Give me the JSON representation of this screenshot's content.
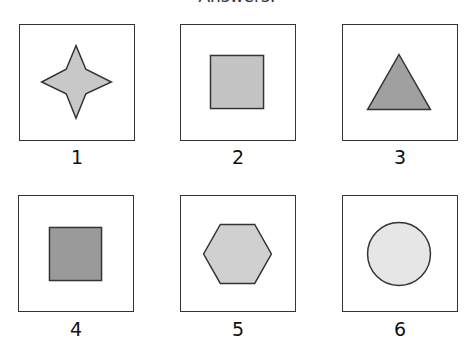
{
  "header": {
    "title": "Answers:"
  },
  "options": [
    {
      "label": "1",
      "shape": "four-point-star",
      "fill": "#c8c8c8"
    },
    {
      "label": "2",
      "shape": "square",
      "fill": "#c4c4c4"
    },
    {
      "label": "3",
      "shape": "triangle",
      "fill": "#a0a0a0"
    },
    {
      "label": "4",
      "shape": "square",
      "fill": "#9a9a9a"
    },
    {
      "label": "5",
      "shape": "hexagon",
      "fill": "#d0d0d0"
    },
    {
      "label": "6",
      "shape": "circle",
      "fill": "#e6e6e6"
    }
  ],
  "colors": {
    "stroke": "#333333",
    "border": "#333333",
    "background": "#ffffff"
  }
}
